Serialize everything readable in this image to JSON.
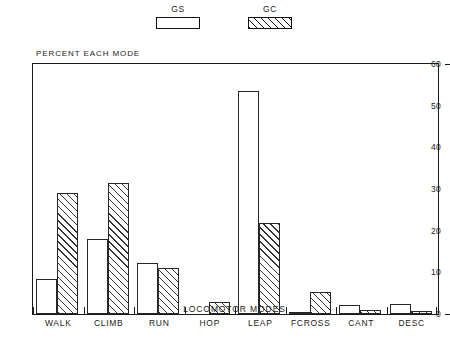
{
  "legend": {
    "entries": [
      {
        "label": "GS",
        "style": "open",
        "icon": "open-rectangle-swatch"
      },
      {
        "label": "GC",
        "style": "hatched",
        "icon": "hatched-rectangle-swatch"
      }
    ]
  },
  "chart_data": {
    "type": "bar",
    "title": "PERCENT EACH MODE",
    "xlabel": "LOCOMOTOR MODES",
    "ylabel": "",
    "categories": [
      "WALK",
      "CLIMB",
      "RUN",
      "HOP",
      "LEAP",
      "FCROSS",
      "CANT",
      "DESC"
    ],
    "series": [
      {
        "name": "GS",
        "values": [
          8.3,
          18.0,
          12.2,
          0.0,
          53.5,
          0.4,
          2.2,
          2.3
        ]
      },
      {
        "name": "GC",
        "values": [
          29.0,
          31.5,
          11.0,
          3.0,
          21.8,
          5.3,
          0.9,
          0.8
        ]
      }
    ],
    "ylim": [
      0,
      60
    ],
    "yticks": [
      0,
      10,
      20,
      30,
      40,
      50,
      60
    ],
    "ytick_labels": [
      "0",
      "10",
      "20",
      "30",
      "40",
      "50",
      "60"
    ],
    "grid": false,
    "legend_position": "top-center",
    "colors": {
      "GS": "#ffffff",
      "GC": "#ffffff",
      "outline": "#1a1a1a",
      "hatch": "#333333"
    }
  }
}
